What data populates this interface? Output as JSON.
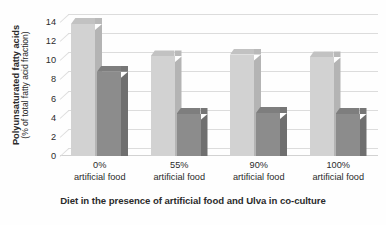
{
  "chart_data": {
    "type": "bar",
    "title": "",
    "subtitle": "",
    "xlabel": "Diet in the presence of artificial food and Ulva in co-culture",
    "ylabel": "Polyunsaturated fatty acids",
    "ylabel_sub": "(% of total fatty acid fraction)",
    "categories": [
      "0% artificial food",
      "55% artificial food",
      "90% artificial food",
      "100% artificial food"
    ],
    "category_lines": [
      {
        "pct": "0%",
        "sub": "artificial food"
      },
      {
        "pct": "55%",
        "sub": "artificial food"
      },
      {
        "pct": "90%",
        "sub": "artificial food"
      },
      {
        "pct": "100%",
        "sub": "artificial food"
      }
    ],
    "series": [
      {
        "name": "light-series",
        "color": "#d2d2d2",
        "values": [
          13.8,
          10.4,
          10.6,
          10.3
        ]
      },
      {
        "name": "dark-series",
        "color": "#8c8c8c",
        "values": [
          8.8,
          4.4,
          4.5,
          4.4
        ]
      }
    ],
    "ylim": [
      0,
      14
    ],
    "yticks": [
      0,
      2,
      4,
      6,
      8,
      10,
      12,
      14
    ],
    "ytick_labels": [
      "0",
      "2",
      "4",
      "6",
      "8",
      "10",
      "12",
      "14"
    ],
    "grid": true,
    "legend": "none",
    "style_3d": true
  }
}
